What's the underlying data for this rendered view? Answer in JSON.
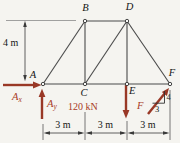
{
  "figure": {
    "nodes": {
      "a": "A",
      "b": "B",
      "c": "C",
      "d": "D",
      "e": "E",
      "f": "F"
    },
    "dims": {
      "height": "4 m",
      "span_ac": "3 m",
      "span_ce": "3 m",
      "span_ef": "3 m"
    },
    "forces": {
      "ax_main": "A",
      "ax_sub": "x",
      "ay_main": "A",
      "ay_sub": "y",
      "load": "120 kN",
      "f": "F",
      "slope_rise": "4",
      "slope_run": "3"
    },
    "colors": {
      "force_red": "#993826",
      "text_red": "#a83b26",
      "member_gray": "#4a4a4a",
      "background": "#f5f4f0"
    }
  }
}
